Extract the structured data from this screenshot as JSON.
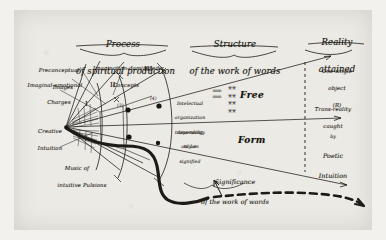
{
  "figure": {
    "medium": "hand-drawn ink diagram on paper (scanned)",
    "ink_color": "#1d1b18",
    "paper_color": "#eceae5"
  },
  "headers": {
    "left_line1": "Process",
    "left_line2": "of spiritual production",
    "center_line1": "Structure",
    "center_line2": "of the work of words",
    "right_line1": "Reality",
    "right_line2": "attained"
  },
  "left_labels": {
    "preconceptual_line1": "Preconceptual",
    "preconceptual_line2": "Images",
    "imaginal_line1": "Imaginal-emotional",
    "imaginal_line2": "Charges",
    "imagination_line1": "Imagination-dominated",
    "imagination_line2": "Concepts",
    "creative_line1": "Creative",
    "creative_line2": "Intuition",
    "music_line1": "Music of",
    "music_line2": "intuitive Pulsions"
  },
  "roman_numerals": [
    "I",
    "II",
    "III"
  ],
  "circled_markers": [
    "(3)",
    "(4)"
  ],
  "center_column": {
    "upper_line1": "Intelectual",
    "upper_line2": "organization",
    "upper_line3": "depending",
    "upper_line4": "only on",
    "lower_line1": "trans-reality",
    "lower_line2": "to be",
    "lower_line3": "signified",
    "word_top": "Free",
    "word_bottom": "Form",
    "star_glyph_column": "✳ ✳ ✳ ✳ ✳ ✳ ✳ ✳",
    "bead_glyph_column": "o o o o o o o o"
  },
  "bottom_caption": {
    "line1": "Significance",
    "line2": "of the work of words"
  },
  "right_labels": {
    "object_line1": "One single",
    "object_line2": "object",
    "object_line3": "(R)",
    "trans_line1": "Trans-reality",
    "trans_line2": "caught",
    "trans_line3": "by",
    "trans_line4": "Poetic",
    "trans_line5": "Intuition"
  }
}
